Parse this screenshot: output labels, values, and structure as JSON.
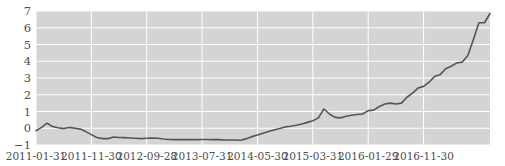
{
  "chart_data": {
    "type": "line",
    "title": "",
    "xlabel": "",
    "ylabel": "",
    "ylim": [
      -1,
      7
    ],
    "yticks": [
      -1,
      0,
      1,
      2,
      3,
      4,
      5,
      6,
      7
    ],
    "ytick_labels": [
      "-1",
      "0",
      "1",
      "2",
      "3",
      "4",
      "5",
      "6",
      "7"
    ],
    "xtick_labels": [
      "2011-01-31",
      "2011-11-30",
      "2012-09-28",
      "2013-07-31",
      "2014-05-30",
      "2015-03-31",
      "2016-01-29",
      "2016-11-30"
    ],
    "xtick_positions": [
      0,
      10,
      20,
      30,
      40,
      50,
      60,
      70
    ],
    "xlim": [
      0,
      77
    ],
    "grid": true,
    "grid_color": "#ffffff",
    "plot_background": "#d4d4d4",
    "line_color": "#555555",
    "line_width": 1.6,
    "legend": null,
    "x": [
      0,
      1,
      2,
      3,
      4,
      5,
      6,
      7,
      8,
      9,
      10,
      11,
      12,
      13,
      14,
      15,
      16,
      17,
      18,
      19,
      20,
      21,
      22,
      23,
      24,
      25,
      26,
      27,
      28,
      29,
      30,
      31,
      32,
      33,
      34,
      35,
      36,
      37,
      38,
      39,
      40,
      41,
      42,
      43,
      44,
      45,
      46,
      47,
      48,
      49,
      50,
      51,
      52,
      53,
      54,
      55,
      56,
      57,
      58,
      59,
      60,
      61,
      62,
      63,
      64,
      65,
      66,
      67,
      68,
      69,
      70,
      71,
      72,
      73,
      74,
      75,
      76,
      77
    ],
    "values": [
      -0.15,
      0.05,
      0.3,
      0.1,
      0.03,
      -0.02,
      0.05,
      0.0,
      -0.05,
      -0.2,
      -0.38,
      -0.55,
      -0.62,
      -0.62,
      -0.52,
      -0.55,
      -0.56,
      -0.58,
      -0.6,
      -0.62,
      -0.6,
      -0.58,
      -0.6,
      -0.64,
      -0.67,
      -0.68,
      -0.68,
      -0.68,
      -0.68,
      -0.68,
      -0.67,
      -0.67,
      -0.68,
      -0.68,
      -0.7,
      -0.7,
      -0.7,
      -0.72,
      -0.62,
      -0.5,
      -0.4,
      -0.3,
      -0.2,
      -0.1,
      -0.02,
      0.08,
      0.12,
      0.18,
      0.25,
      0.35,
      0.45,
      0.62,
      1.15,
      0.85,
      0.65,
      0.62,
      0.72,
      0.78,
      0.82,
      0.85,
      1.05,
      1.08,
      1.3,
      1.45,
      1.5,
      1.45,
      1.5,
      1.85,
      2.1,
      2.4,
      2.5,
      2.75,
      3.1,
      3.2,
      3.55,
      3.7,
      3.9,
      3.95
    ],
    "series_note": "monthly cumulative series"
  },
  "chart_tail": {
    "x": [
      78,
      79,
      80,
      81,
      82
    ],
    "values": [
      4.35,
      5.3,
      6.3,
      6.3,
      6.85
    ]
  },
  "axes": {
    "y_axis_name": "y-axis",
    "x_axis_name": "x-axis"
  }
}
